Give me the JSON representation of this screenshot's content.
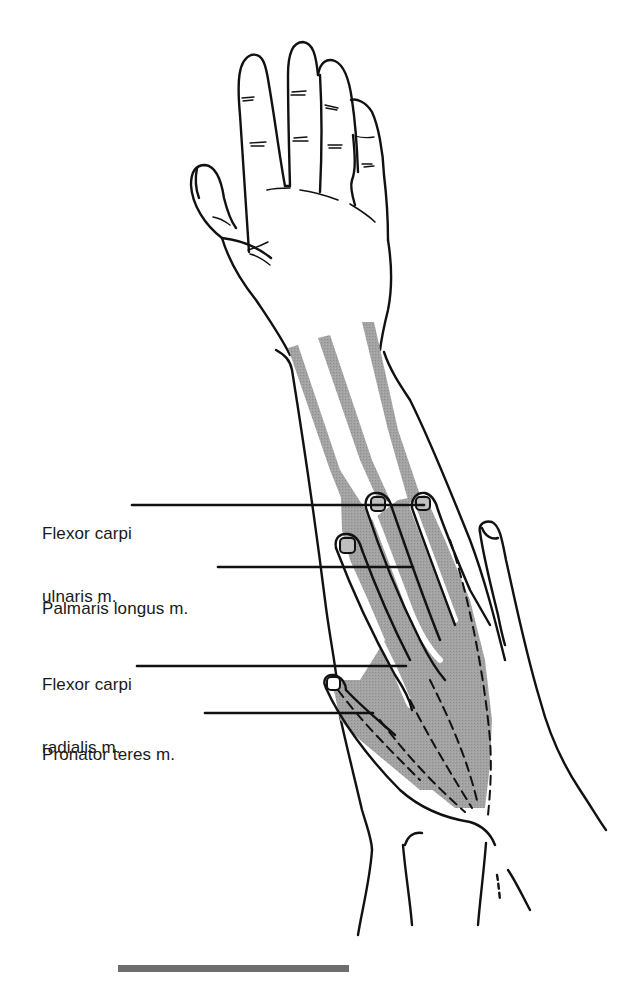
{
  "figure": {
    "colors": {
      "outline": "#111111",
      "muscle_shading": "#9a9a9a",
      "background": "#ffffff",
      "scale_bar": "#6e6e6e"
    },
    "labels": [
      {
        "id": "flexor-carpi-ulnaris",
        "line1": "Flexor carpi",
        "line2": "ulnaris m."
      },
      {
        "id": "palmaris-longus",
        "line1": "Palmaris longus m.",
        "line2": ""
      },
      {
        "id": "flexor-carpi-radialis",
        "line1": "Flexor carpi",
        "line2": "radialis m."
      },
      {
        "id": "pronator-teres",
        "line1": "Pronator teres m.",
        "line2": ""
      }
    ]
  }
}
